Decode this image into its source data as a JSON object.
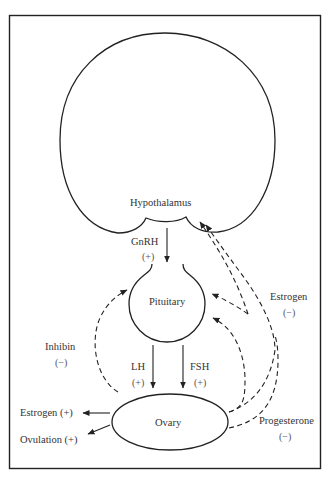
{
  "diagram": {
    "type": "hormonal-feedback-loop",
    "nodes": {
      "hypothalamus": "Hypothalamus",
      "pituitary": "Pituitary",
      "ovary": "Ovary"
    },
    "stimulatory": {
      "gnrh": {
        "label": "GnRH",
        "sign": "(+)"
      },
      "lh": {
        "label": "LH",
        "sign": "(+)"
      },
      "fsh": {
        "label": "FSH",
        "sign": "(+)"
      }
    },
    "feedback": {
      "inhibin": {
        "label": "Inhibin",
        "sign": "(−)"
      },
      "estrogen": {
        "label": "Estrogen",
        "sign": "(−)"
      },
      "progesterone": {
        "label": "Progesterone",
        "sign": "(−)"
      }
    },
    "outputs": {
      "estrogen": "Estrogen  (+)",
      "ovulation": "Ovulation  (+)"
    }
  }
}
